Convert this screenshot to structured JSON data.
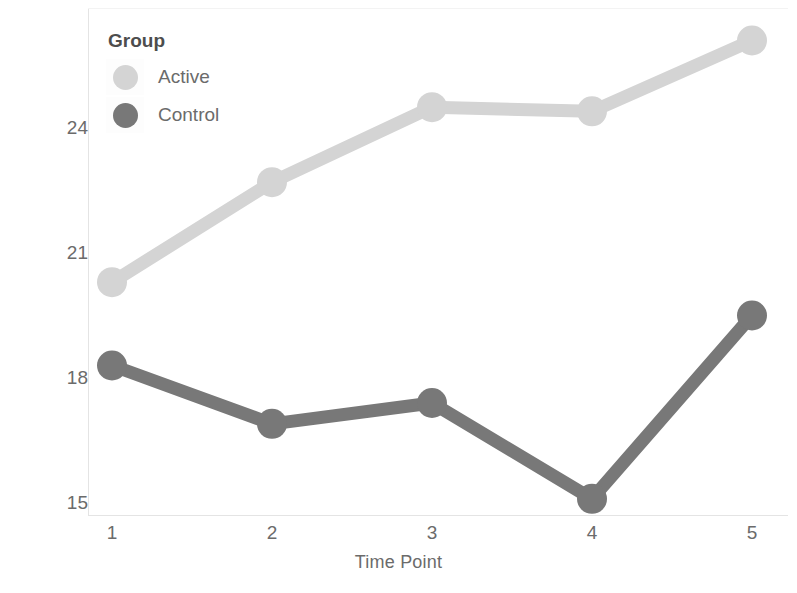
{
  "chart_data": {
    "type": "line",
    "title": "",
    "xlabel": "Time Point",
    "ylabel": "Average Number of Lifts",
    "categories": [
      "1",
      "2",
      "3",
      "4",
      "5"
    ],
    "x": [
      1,
      2,
      3,
      4,
      5
    ],
    "xlim": [
      0.75,
      5.25
    ],
    "ylim": [
      14.8,
      26.6
    ],
    "yticks": [
      15,
      18,
      21,
      24
    ],
    "ytick_labels": [
      "15",
      "18",
      "21",
      "24"
    ],
    "xtick_labels": [
      "1",
      "2",
      "3",
      "4",
      "5"
    ],
    "grid": false,
    "legend_position": "upper-left",
    "legend_title": "Group",
    "series": [
      {
        "name": "Active",
        "color": "#d4d4d4",
        "marker": "circle",
        "values": [
          20.3,
          22.7,
          24.5,
          24.4,
          26.1
        ]
      },
      {
        "name": "Control",
        "color": "#787878",
        "marker": "circle",
        "values": [
          18.3,
          16.9,
          17.4,
          15.1,
          19.5
        ]
      }
    ]
  },
  "axes": {
    "y_title": "Average Number of Lifts",
    "x_title": "Time Point",
    "y_tick_0": "15",
    "y_tick_1": "18",
    "y_tick_2": "21",
    "y_tick_3": "24",
    "x_tick_0": "1",
    "x_tick_1": "2",
    "x_tick_2": "3",
    "x_tick_3": "4",
    "x_tick_4": "5"
  },
  "legend": {
    "title": "Group",
    "items": [
      {
        "label": "Active",
        "color": "#d4d4d4"
      },
      {
        "label": "Control",
        "color": "#787878"
      }
    ]
  },
  "colors": {
    "background": "#ffffff",
    "axis_text": "#6b6b6b",
    "spine": "#e4e4e4",
    "active": "#d4d4d4",
    "control": "#787878"
  }
}
